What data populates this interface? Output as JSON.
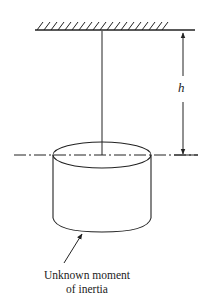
{
  "diagram": {
    "dimension_label": "h",
    "caption_line1": "Unknown moment",
    "caption_line2": "of inertia",
    "colors": {
      "line": "#222222",
      "background": "#ffffff"
    }
  }
}
